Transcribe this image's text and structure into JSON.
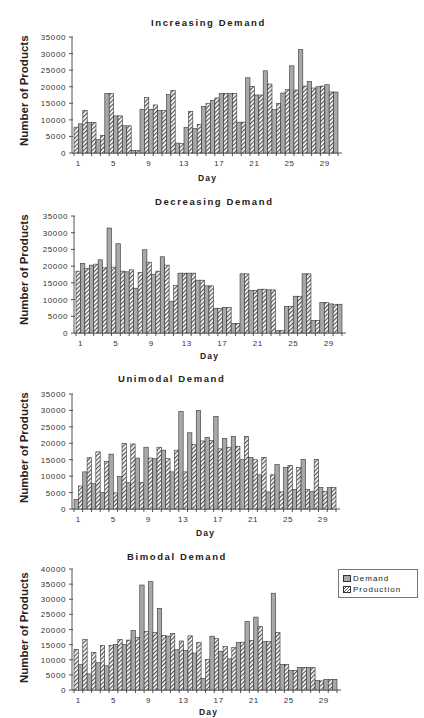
{
  "legend": {
    "items": [
      {
        "label": "Demand",
        "color": "#a8a8a8",
        "pattern": "solid"
      },
      {
        "label": "Production",
        "color": "#555555",
        "pattern": "hatched"
      }
    ]
  },
  "chart_data": [
    {
      "type": "bar",
      "title": "Increasing Demand",
      "xlabel": "Day",
      "ylabel": "Number of Products",
      "ylim": [
        0,
        35000
      ],
      "yticks": [
        0,
        5000,
        10000,
        15000,
        20000,
        25000,
        30000,
        35000
      ],
      "xticks": [
        "1",
        "5",
        "9",
        "13",
        "17",
        "21",
        "25",
        "29"
      ],
      "categories": [
        1,
        2,
        3,
        4,
        5,
        6,
        7,
        8,
        9,
        10,
        11,
        12,
        13,
        14,
        15,
        16,
        17,
        18,
        19,
        20,
        21,
        22,
        23,
        24,
        25,
        26,
        27,
        28,
        29,
        30
      ],
      "first_bar": "Production",
      "series": [
        {
          "name": "Demand",
          "values": [
            8800,
            9200,
            4000,
            17900,
            11200,
            8200,
            700,
            13200,
            13200,
            12800,
            17600,
            3000,
            7700,
            7400,
            14000,
            15800,
            17900,
            17900,
            9300,
            22700,
            17500,
            24800,
            13100,
            18100,
            26300,
            31200,
            21600,
            20000,
            20600,
            18400
          ]
        },
        {
          "name": "Production",
          "values": [
            7800,
            12900,
            9200,
            5300,
            17900,
            11200,
            8200,
            700,
            16700,
            14500,
            12800,
            18900,
            2800,
            12500,
            8600,
            14900,
            16600,
            17900,
            17900,
            9300,
            20100,
            17500,
            20800,
            15000,
            19200,
            19000,
            20200,
            19600,
            20200,
            18400
          ]
        }
      ]
    },
    {
      "type": "bar",
      "title": "Decreasing Demand",
      "xlabel": "Day",
      "ylabel": "Number of Products",
      "ylim": [
        0,
        35000
      ],
      "yticks": [
        0,
        5000,
        10000,
        15000,
        20000,
        25000,
        30000,
        35000
      ],
      "xticks": [
        "1",
        "5",
        "9",
        "13",
        "17",
        "21",
        "25",
        "29"
      ],
      "categories": [
        1,
        2,
        3,
        4,
        5,
        6,
        7,
        8,
        9,
        10,
        11,
        12,
        13,
        14,
        15,
        16,
        17,
        18,
        19,
        20,
        21,
        22,
        23,
        24,
        25,
        26,
        27,
        28,
        29,
        30
      ],
      "first_bar": "Production",
      "series": [
        {
          "name": "Demand",
          "values": [
            20800,
            20300,
            21900,
            31400,
            26700,
            18300,
            13400,
            24900,
            17600,
            22800,
            9500,
            17900,
            17900,
            15800,
            14100,
            7400,
            7600,
            2900,
            17700,
            12700,
            13100,
            12900,
            700,
            8000,
            11000,
            17700,
            3700,
            9100,
            8700,
            8600
          ]
        },
        {
          "name": "Production",
          "values": [
            18500,
            19300,
            20600,
            19500,
            19700,
            18500,
            18900,
            18100,
            21200,
            18500,
            20300,
            14200,
            17900,
            17900,
            15800,
            14100,
            7400,
            7600,
            2900,
            17700,
            12700,
            13100,
            12900,
            700,
            8000,
            11000,
            17700,
            3700,
            9100,
            8600
          ]
        }
      ]
    },
    {
      "type": "bar",
      "title": "Unimodal Demand",
      "xlabel": "Day",
      "ylabel": "Number of Products",
      "ylim": [
        0,
        35000
      ],
      "yticks": [
        0,
        5000,
        10000,
        15000,
        20000,
        25000,
        30000,
        35000
      ],
      "xticks": [
        "1",
        "5",
        "9",
        "13",
        "17",
        "21",
        "25",
        "29"
      ],
      "categories": [
        1,
        2,
        3,
        4,
        5,
        6,
        7,
        8,
        9,
        10,
        11,
        12,
        13,
        14,
        15,
        16,
        17,
        18,
        19,
        20,
        21,
        22,
        23,
        24,
        25,
        26,
        27,
        28,
        29,
        30
      ],
      "first_bar": "Demand",
      "series": [
        {
          "name": "Demand",
          "values": [
            2900,
            11300,
            7700,
            5000,
            16700,
            9900,
            8000,
            15500,
            18800,
            15300,
            17900,
            11300,
            29700,
            23200,
            30000,
            21800,
            28200,
            21500,
            22100,
            15000,
            15700,
            10400,
            5200,
            13500,
            12600,
            5900,
            15100,
            5300,
            6600,
            6500
          ]
        },
        {
          "name": "Production",
          "values": [
            7000,
            15600,
            17400,
            14400,
            4900,
            20000,
            19800,
            8000,
            15500,
            18800,
            15300,
            17900,
            11300,
            19700,
            20700,
            20800,
            18300,
            18800,
            19100,
            22100,
            15000,
            15700,
            10400,
            5200,
            13300,
            12700,
            5900,
            15100,
            5300,
            6500
          ]
        }
      ]
    },
    {
      "type": "bar",
      "title": "Bimodal Demand",
      "xlabel": "Day",
      "ylabel": "Number of Products",
      "ylim": [
        0,
        40000
      ],
      "yticks": [
        0,
        5000,
        10000,
        15000,
        20000,
        25000,
        30000,
        35000,
        40000
      ],
      "xticks": [
        "1",
        "5",
        "9",
        "13",
        "17",
        "21",
        "25",
        "29"
      ],
      "categories": [
        1,
        2,
        3,
        4,
        5,
        6,
        7,
        8,
        9,
        10,
        11,
        12,
        13,
        14,
        15,
        16,
        17,
        18,
        19,
        20,
        21,
        22,
        23,
        24,
        25,
        26,
        27,
        28,
        29,
        30
      ],
      "first_bar": "Production",
      "series": [
        {
          "name": "Demand",
          "values": [
            8400,
            5300,
            9000,
            8000,
            15000,
            15000,
            19700,
            34700,
            35800,
            27000,
            17800,
            13300,
            13000,
            12200,
            3800,
            17800,
            12800,
            10300,
            15700,
            22600,
            24100,
            16000,
            32000,
            8500,
            6500,
            7400,
            7400,
            3100,
            3500,
            3500
          ]
        },
        {
          "name": "Production",
          "values": [
            13400,
            16700,
            12400,
            14700,
            14800,
            16700,
            16500,
            17300,
            19300,
            19000,
            18000,
            18700,
            16200,
            17900,
            15700,
            10100,
            17000,
            14400,
            14000,
            15800,
            16300,
            21000,
            16000,
            19000,
            8400,
            6400,
            7400,
            7400,
            3000,
            3500
          ]
        }
      ],
      "legend_position": "right"
    }
  ]
}
